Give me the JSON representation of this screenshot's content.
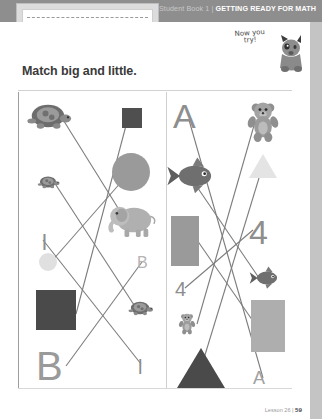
{
  "header": {
    "book_label": "Student Book 1",
    "separator": "|",
    "strapline": "GETTING READY FOR MATH",
    "name_line_placeholder": ""
  },
  "callout": {
    "line1": "Now you",
    "line2": "try!",
    "mascot": "dog-illustration"
  },
  "title": "Match big and little.",
  "footer": {
    "lesson": "Lesson 26",
    "separator": "|",
    "page": "59"
  },
  "colors": {
    "band": "#8e8e8e",
    "sheet": "#ffffff",
    "dark_shape": "#4a4a4a",
    "mid_shape": "#9a9a9a",
    "light_shape": "#e2e2e2",
    "line": "#7d7d7d",
    "title_text": "#3a3a3a"
  },
  "activity": {
    "type": "match-big-and-little",
    "instruction": "Match big and little.",
    "panels": [
      {
        "name": "left-panel",
        "left_column": [
          {
            "id": "L1",
            "kind": "turtle",
            "size": "big",
            "label": "turtle",
            "y": 22
          },
          {
            "id": "L2",
            "kind": "turtle",
            "size": "little",
            "label": "turtle",
            "y": 88
          },
          {
            "id": "L3",
            "kind": "letter",
            "size": "little",
            "label": "l",
            "y": 140
          },
          {
            "id": "L4",
            "kind": "circle",
            "size": "little",
            "label": "circle",
            "y": 168
          },
          {
            "id": "L5",
            "kind": "square",
            "size": "big",
            "label": "square",
            "y": 215
          },
          {
            "id": "L6",
            "kind": "letter",
            "size": "big",
            "label": "B",
            "y": 272
          }
        ],
        "right_column": [
          {
            "id": "R1",
            "kind": "square",
            "size": "little",
            "label": "square",
            "y": 22
          },
          {
            "id": "R2",
            "kind": "circle",
            "size": "big",
            "label": "circle",
            "y": 75
          },
          {
            "id": "R3",
            "kind": "elephant",
            "size": "big",
            "label": "elephant",
            "y": 120
          },
          {
            "id": "R4",
            "kind": "letter",
            "size": "little",
            "label": "B",
            "y": 168
          },
          {
            "id": "R5",
            "kind": "turtle",
            "size": "little",
            "label": "turtle",
            "y": 215
          },
          {
            "id": "R6",
            "kind": "letter",
            "size": "little",
            "label": "l",
            "y": 272
          }
        ],
        "matches": [
          {
            "from": "L1",
            "to": "R3"
          },
          {
            "from": "L2",
            "to": "R5"
          },
          {
            "from": "L3",
            "to": "R6"
          },
          {
            "from": "L4",
            "to": "R2"
          },
          {
            "from": "L5",
            "to": "R1"
          },
          {
            "from": "L6",
            "to": "R4"
          }
        ]
      },
      {
        "name": "right-panel",
        "left_column": [
          {
            "id": "A1",
            "kind": "letter",
            "size": "big",
            "label": "A",
            "y": 18
          },
          {
            "id": "A2",
            "kind": "fish",
            "size": "big",
            "label": "fish",
            "y": 78
          },
          {
            "id": "A3",
            "kind": "rectangle",
            "size": "big",
            "label": "rectangle",
            "y": 128
          },
          {
            "id": "A4",
            "kind": "number",
            "size": "little",
            "label": "4",
            "y": 190
          },
          {
            "id": "A5",
            "kind": "bear",
            "size": "little",
            "label": "bear",
            "y": 228
          },
          {
            "id": "A6",
            "kind": "triangle",
            "size": "big",
            "label": "triangle",
            "y": 275
          }
        ],
        "right_column": [
          {
            "id": "B1",
            "kind": "bear",
            "size": "big",
            "label": "bear",
            "y": 18
          },
          {
            "id": "B2",
            "kind": "triangle",
            "size": "little",
            "label": "triangle",
            "y": 75
          },
          {
            "id": "B3",
            "kind": "number",
            "size": "big",
            "label": "4",
            "y": 128
          },
          {
            "id": "B4",
            "kind": "fish",
            "size": "little",
            "label": "fish",
            "y": 182
          },
          {
            "id": "B5",
            "kind": "rectangle",
            "size": "little",
            "label": "rectangle",
            "y": 222
          },
          {
            "id": "B6",
            "kind": "letter",
            "size": "little",
            "label": "A",
            "y": 282
          }
        ],
        "matches": [
          {
            "from": "A1",
            "to": "B6"
          },
          {
            "from": "A2",
            "to": "B4"
          },
          {
            "from": "A3",
            "to": "B5"
          },
          {
            "from": "A4",
            "to": "B3"
          },
          {
            "from": "A5",
            "to": "B1"
          },
          {
            "from": "A6",
            "to": "B2"
          }
        ]
      }
    ]
  }
}
